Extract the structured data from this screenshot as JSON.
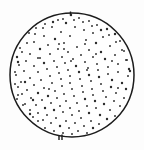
{
  "figure": {
    "kind": "scatter-in-circle",
    "title": "",
    "background_color": "#fdfdfd",
    "dish": {
      "label": "circular-dish-outline",
      "center_x": 72,
      "center_y": 75,
      "radius": 62,
      "stroke_color": "#1c1c1c",
      "fill_color": "#ffffff",
      "stroke_width": 1.5
    },
    "ticks": [
      {
        "name": "top-tick",
        "x1": 70.5,
        "y1": 11.5,
        "x2": 70.5,
        "y2": 15.5
      },
      {
        "name": "bottom-tick-left",
        "x1": 59.0,
        "y1": 135.0,
        "x2": 59.0,
        "y2": 140.0
      },
      {
        "name": "bottom-tick-right",
        "x1": 62.0,
        "y1": 134.5,
        "x2": 62.0,
        "y2": 140.0
      }
    ],
    "dot_color": "#2a2a2a",
    "dot_radius": 0.95,
    "dot_count": 206
  },
  "chart_data": {
    "type": "scatter",
    "title": "",
    "xlabel": "",
    "ylabel": "",
    "grid": false,
    "legend": null,
    "xlim": [
      10,
      134
    ],
    "ylim": [
      13,
      137
    ],
    "annotations": [],
    "points": [
      [
        71,
        15
      ],
      [
        79,
        18
      ],
      [
        58,
        20
      ],
      [
        89,
        21
      ],
      [
        45,
        24
      ],
      [
        66,
        23
      ],
      [
        97,
        25
      ],
      [
        36,
        28
      ],
      [
        52,
        27
      ],
      [
        75,
        27
      ],
      [
        107,
        29
      ],
      [
        84,
        30
      ],
      [
        29,
        33
      ],
      [
        61,
        32
      ],
      [
        93,
        33
      ],
      [
        115,
        34
      ],
      [
        44,
        36
      ],
      [
        70,
        36
      ],
      [
        103,
        37
      ],
      [
        23,
        39
      ],
      [
        55,
        39
      ],
      [
        86,
        40
      ],
      [
        120,
        41
      ],
      [
        34,
        42
      ],
      [
        64,
        43
      ],
      [
        96,
        43
      ],
      [
        48,
        45
      ],
      [
        110,
        46
      ],
      [
        77,
        47
      ],
      [
        20,
        48
      ],
      [
        40,
        49
      ],
      [
        58,
        49
      ],
      [
        89,
        50
      ],
      [
        124,
        51
      ],
      [
        68,
        52
      ],
      [
        101,
        52
      ],
      [
        30,
        54
      ],
      [
        50,
        54
      ],
      [
        81,
        55
      ],
      [
        115,
        55
      ],
      [
        17,
        57
      ],
      [
        62,
        57
      ],
      [
        93,
        57
      ],
      [
        38,
        58
      ],
      [
        73,
        59
      ],
      [
        105,
        59
      ],
      [
        127,
        60
      ],
      [
        26,
        61
      ],
      [
        54,
        61
      ],
      [
        85,
        62
      ],
      [
        44,
        63
      ],
      [
        65,
        63
      ],
      [
        97,
        64
      ],
      [
        118,
        64
      ],
      [
        19,
        65
      ],
      [
        76,
        66
      ],
      [
        34,
        66
      ],
      [
        57,
        67
      ],
      [
        108,
        67
      ],
      [
        88,
        68
      ],
      [
        129,
        69
      ],
      [
        47,
        69
      ],
      [
        68,
        70
      ],
      [
        98,
        70
      ],
      [
        24,
        71
      ],
      [
        79,
        72
      ],
      [
        38,
        72
      ],
      [
        59,
        73
      ],
      [
        118,
        72
      ],
      [
        108,
        74
      ],
      [
        89,
        75
      ],
      [
        16,
        75
      ],
      [
        50,
        76
      ],
      [
        70,
        76
      ],
      [
        128,
        76
      ],
      [
        99,
        77
      ],
      [
        30,
        78
      ],
      [
        61,
        79
      ],
      [
        80,
        79
      ],
      [
        41,
        80
      ],
      [
        112,
        80
      ],
      [
        91,
        81
      ],
      [
        21,
        82
      ],
      [
        70,
        83
      ],
      [
        52,
        83
      ],
      [
        122,
        83
      ],
      [
        101,
        84
      ],
      [
        34,
        85
      ],
      [
        82,
        86
      ],
      [
        62,
        86
      ],
      [
        111,
        87
      ],
      [
        18,
        87
      ],
      [
        44,
        88
      ],
      [
        92,
        89
      ],
      [
        72,
        89
      ],
      [
        126,
        89
      ],
      [
        27,
        90
      ],
      [
        55,
        91
      ],
      [
        103,
        91
      ],
      [
        83,
        92
      ],
      [
        38,
        93
      ],
      [
        116,
        93
      ],
      [
        64,
        94
      ],
      [
        22,
        94
      ],
      [
        93,
        95
      ],
      [
        48,
        96
      ],
      [
        74,
        96
      ],
      [
        106,
        97
      ],
      [
        31,
        98
      ],
      [
        57,
        98
      ],
      [
        85,
        99
      ],
      [
        124,
        98
      ],
      [
        17,
        99
      ],
      [
        42,
        100
      ],
      [
        66,
        101
      ],
      [
        95,
        101
      ],
      [
        114,
        101
      ],
      [
        51,
        103
      ],
      [
        77,
        103
      ],
      [
        25,
        104
      ],
      [
        104,
        104
      ],
      [
        36,
        105
      ],
      [
        60,
        106
      ],
      [
        87,
        106
      ],
      [
        120,
        106
      ],
      [
        45,
        108
      ],
      [
        70,
        108
      ],
      [
        96,
        108
      ],
      [
        19,
        108
      ],
      [
        30,
        110
      ],
      [
        54,
        110
      ],
      [
        79,
        111
      ],
      [
        110,
        110
      ],
      [
        63,
        112
      ],
      [
        38,
        113
      ],
      [
        89,
        113
      ],
      [
        124,
        112
      ],
      [
        24,
        114
      ],
      [
        47,
        115
      ],
      [
        72,
        115
      ],
      [
        100,
        115
      ],
      [
        115,
        116
      ],
      [
        33,
        117
      ],
      [
        56,
        118
      ],
      [
        81,
        118
      ],
      [
        107,
        119
      ],
      [
        43,
        120
      ],
      [
        66,
        121
      ],
      [
        91,
        121
      ],
      [
        27,
        121
      ],
      [
        119,
        122
      ],
      [
        51,
        123
      ],
      [
        75,
        123
      ],
      [
        99,
        124
      ],
      [
        36,
        125
      ],
      [
        60,
        126
      ],
      [
        84,
        126
      ],
      [
        110,
        126
      ],
      [
        45,
        128
      ],
      [
        69,
        128
      ],
      [
        93,
        128
      ],
      [
        29,
        127
      ],
      [
        102,
        130
      ],
      [
        54,
        131
      ],
      [
        78,
        131
      ],
      [
        38,
        132
      ],
      [
        63,
        133
      ],
      [
        87,
        133
      ],
      [
        47,
        134
      ],
      [
        72,
        134
      ],
      [
        95,
        133
      ],
      [
        56,
        136
      ],
      [
        80,
        136
      ],
      [
        65,
        137
      ],
      [
        104,
        131
      ],
      [
        113,
        128
      ],
      [
        121,
        117
      ],
      [
        127,
        107
      ],
      [
        131,
        95
      ],
      [
        132,
        83
      ],
      [
        130,
        71
      ],
      [
        126,
        60
      ],
      [
        122,
        50
      ],
      [
        116,
        42
      ],
      [
        109,
        35
      ],
      [
        101,
        30
      ],
      [
        92,
        26
      ],
      [
        83,
        22
      ],
      [
        74,
        20
      ],
      [
        63,
        19
      ],
      [
        53,
        22
      ],
      [
        43,
        28
      ],
      [
        35,
        34
      ],
      [
        27,
        43
      ],
      [
        22,
        52
      ],
      [
        18,
        62
      ],
      [
        15,
        72
      ],
      [
        15,
        84
      ],
      [
        18,
        95
      ],
      [
        23,
        105
      ],
      [
        30,
        114
      ],
      [
        38,
        121
      ],
      [
        85,
        44
      ],
      [
        59,
        44
      ],
      [
        112,
        61
      ],
      [
        25,
        82
      ],
      [
        96,
        54
      ],
      [
        40,
        58
      ],
      [
        71,
        61
      ],
      [
        118,
        88
      ],
      [
        33,
        100
      ],
      [
        87,
        70
      ],
      [
        64,
        49
      ],
      [
        49,
        89
      ]
    ]
  }
}
